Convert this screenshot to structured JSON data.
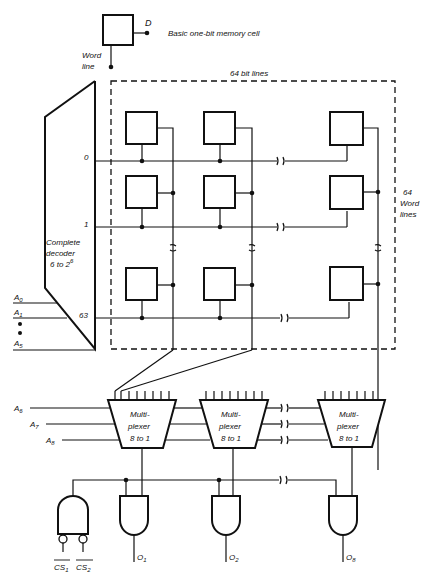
{
  "legend": {
    "cell_label": "Basic one-bit memory cell",
    "data_pin": "D",
    "word_line_label_1": "Word",
    "word_line_label_2": "line"
  },
  "array": {
    "bit_lines_label": "64 bit lines",
    "word_lines_label_1": "64",
    "word_lines_label_2": "Word",
    "word_lines_label_3": "lines",
    "row_labels": [
      "0",
      "1",
      "63"
    ]
  },
  "decoder": {
    "line1": "Complete",
    "line2": "decoder",
    "line3": "6 to 2",
    "line3_sup": "6",
    "inputs": [
      "A",
      "A",
      "A"
    ],
    "input_subs": [
      "0",
      "1",
      "5"
    ]
  },
  "multiplexers": {
    "line1": "Multi-",
    "line2": "plexer",
    "line3": "8 to 1",
    "count": 3,
    "select_inputs": [
      "A",
      "A",
      "A"
    ],
    "select_subs": [
      "6",
      "7",
      "8"
    ]
  },
  "chip_select": {
    "inputs": [
      "CS",
      "CS"
    ],
    "input_subs": [
      "1",
      "2"
    ]
  },
  "outputs": {
    "labels": [
      "O",
      "O",
      "O"
    ],
    "subs": [
      "1",
      "2",
      "8"
    ]
  }
}
